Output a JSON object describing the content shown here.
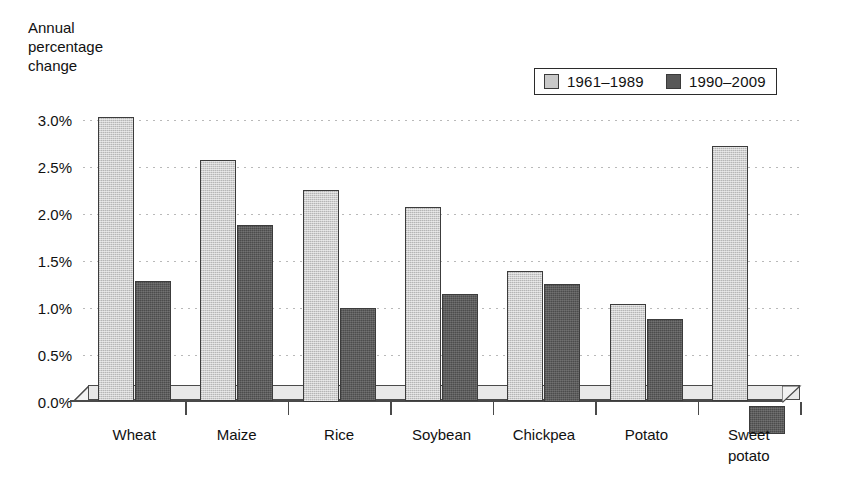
{
  "chart_data": {
    "type": "bar",
    "title": "",
    "ylabel": "Annual\npercentage\nchange",
    "xlabel": "",
    "categories": [
      "Wheat",
      "Maize",
      "Rice",
      "Soybean",
      "Chickpea",
      "Potato",
      "Sweet\npotato"
    ],
    "series": [
      {
        "name": "1961–1989",
        "color": "#cfcfcf",
        "values": [
          3.03,
          2.57,
          2.25,
          2.07,
          1.39,
          1.04,
          2.72
        ]
      },
      {
        "name": "1990–2009",
        "color": "#5d5d5d",
        "values": [
          1.28,
          1.88,
          0.99,
          1.14,
          1.25,
          0.88,
          -0.3
        ]
      }
    ],
    "ylim": [
      -0.35,
      3.05
    ],
    "yticks": [
      0.0,
      0.5,
      1.0,
      1.5,
      2.0,
      2.5,
      3.0
    ],
    "ytick_labels": [
      "0.0%",
      "0.5%",
      "1.0%",
      "1.5%",
      "2.0%",
      "2.5%",
      "3.0%"
    ],
    "grid": true,
    "grid_style": "dotted",
    "legend_position": "top-right",
    "value_format": "percent"
  },
  "axis_title": {
    "text": "Annual\npercentage\nchange"
  },
  "legend": {
    "items": [
      {
        "label": "1961–1989",
        "swatch": "light-gray-square"
      },
      {
        "label": "1990–2009",
        "swatch": "dark-gray-square"
      }
    ]
  },
  "colors": {
    "series_light": "#cfcfcf",
    "series_dark": "#5d5d5d",
    "bar_border": "#3c3c3c",
    "gridline": "#b9b9b9",
    "axis": "#4a4a4a",
    "base_slab": "#e8e8e8",
    "text": "#111111",
    "background": "#ffffff"
  }
}
